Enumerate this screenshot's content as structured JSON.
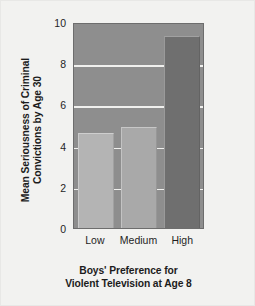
{
  "chart_data": {
    "type": "bar",
    "title": "",
    "subtitle": "",
    "categories": [
      "Low",
      "Medium",
      "High"
    ],
    "values": [
      4.6,
      4.9,
      9.3
    ],
    "series": [
      {
        "name": "Mean Seriousness of Criminal Convictions by Age 30",
        "values": [
          4.6,
          4.9,
          9.3
        ]
      }
    ],
    "xlabel_lines": [
      "Boys' Preference for",
      "Violent Television at Age 8"
    ],
    "ylabel_lines": [
      "Mean Seriousness of Criminal",
      "Convictions by Age 30"
    ],
    "ylim": [
      0,
      10
    ],
    "yticks": [
      0,
      2,
      4,
      6,
      8,
      10
    ],
    "ytick_labels": [
      "0",
      "2",
      "4",
      "6",
      "8",
      "10"
    ],
    "gridlines": [
      2,
      4,
      6,
      8
    ],
    "grid": true,
    "legend": false,
    "legend_position": "none",
    "bar_colors": [
      "#b4b4b4",
      "#a9a9a9",
      "#6f6f6f"
    ],
    "plot_background": "#8e8e8e",
    "gridline_color": "#f0f0ee",
    "figure_background": "#f2f2f0",
    "text_color": "#1c1c1c"
  }
}
